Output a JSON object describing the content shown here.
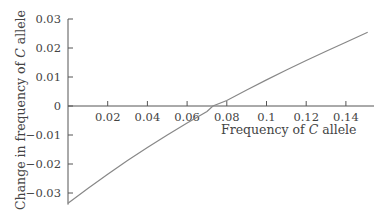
{
  "chart_data": {
    "type": "line",
    "title": "",
    "xlabel": "Frequency of C allele",
    "ylabel": "Change in frequency of C allele",
    "xlim": [
      0,
      0.15
    ],
    "ylim": [
      -0.034,
      0.03
    ],
    "x_ticks": [
      "0.02",
      "0.04",
      "0.06",
      "0.08",
      "0.1",
      "0.12",
      "0.14"
    ],
    "y_ticks": [
      "0.03",
      "0.02",
      "0.01",
      "0",
      "-0.01",
      "-0.02",
      "-0.03"
    ],
    "grid": false,
    "legend": null,
    "series": [
      {
        "name": "Change in frequency",
        "color": "#888888",
        "x": [
          0.0,
          0.01,
          0.02,
          0.03,
          0.04,
          0.05,
          0.06,
          0.07,
          0.073,
          0.08,
          0.09,
          0.1,
          0.11,
          0.12,
          0.13,
          0.14,
          0.151
        ],
        "y": [
          -0.0335,
          -0.0284,
          -0.0235,
          -0.0188,
          -0.0143,
          -0.01,
          -0.0059,
          -0.0019,
          0.0,
          0.0019,
          0.0055,
          0.009,
          0.0124,
          0.0157,
          0.0189,
          0.022,
          0.0254
        ]
      }
    ]
  },
  "labels": {
    "xlabel_prefix": "Frequency of ",
    "xlabel_italic": "C",
    "xlabel_suffix": " allele",
    "ylabel_prefix": "Change in frequency of ",
    "ylabel_italic": "C",
    "ylabel_suffix": " allele"
  }
}
